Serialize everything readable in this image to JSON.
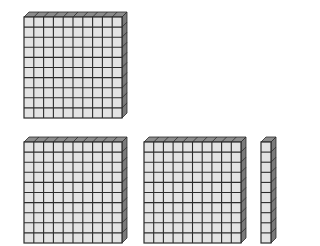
{
  "colors": {
    "cell_fill": "#e3e3e3",
    "grid_line": "#2b2b2b",
    "top_face": "#8c8c8c",
    "side_face": "#7a7a7a",
    "background": "#ffffff"
  },
  "blocks": [
    {
      "type": "hundreds-flat",
      "value": 100,
      "cols": 10,
      "rows": 10,
      "x": 24,
      "y": 17,
      "w": 98,
      "h": 101
    },
    {
      "type": "hundreds-flat",
      "value": 100,
      "cols": 10,
      "rows": 10,
      "x": 24,
      "y": 142,
      "w": 98,
      "h": 101
    },
    {
      "type": "hundreds-flat",
      "value": 100,
      "cols": 10,
      "rows": 10,
      "x": 144,
      "y": 142,
      "w": 97,
      "h": 101
    },
    {
      "type": "tens-rod",
      "value": 10,
      "cols": 1,
      "rows": 10,
      "x": 261,
      "y": 142,
      "w": 10,
      "h": 101
    }
  ],
  "depth": 5
}
